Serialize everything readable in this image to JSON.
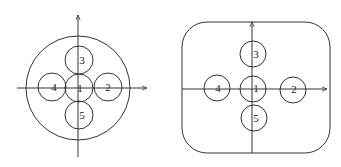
{
  "figures": [
    {
      "name": "circular-boundary-layout",
      "outer_shape": "circle",
      "circles": [
        {
          "label": "1",
          "cx": 79,
          "cy": 88,
          "r": 14,
          "lx": 80,
          "ly": 92
        },
        {
          "label": "2",
          "cx": 108,
          "cy": 87,
          "r": 14,
          "lx": 108,
          "ly": 91
        },
        {
          "label": "3",
          "cx": 79,
          "cy": 60,
          "r": 14,
          "lx": 82,
          "ly": 64
        },
        {
          "label": "4",
          "cx": 52,
          "cy": 87,
          "r": 14,
          "lx": 54,
          "ly": 91
        },
        {
          "label": "5",
          "cx": 79,
          "cy": 115,
          "r": 14,
          "lx": 82,
          "ly": 119
        }
      ]
    },
    {
      "name": "rounded-square-boundary-layout",
      "outer_shape": "rounded-square",
      "circles": [
        {
          "label": "1",
          "cx": 253,
          "cy": 89,
          "r": 13,
          "lx": 256,
          "ly": 92
        },
        {
          "label": "2",
          "cx": 293,
          "cy": 90,
          "r": 13,
          "lx": 294,
          "ly": 93
        },
        {
          "label": "3",
          "cx": 253,
          "cy": 54,
          "r": 13,
          "lx": 256,
          "ly": 58
        },
        {
          "label": "4",
          "cx": 217,
          "cy": 88,
          "r": 13,
          "lx": 218,
          "ly": 92
        },
        {
          "label": "5",
          "cx": 254,
          "cy": 118,
          "r": 13,
          "lx": 256,
          "ly": 122
        }
      ]
    }
  ],
  "colors": {
    "stroke": "#333333",
    "background": "#ffffff"
  }
}
